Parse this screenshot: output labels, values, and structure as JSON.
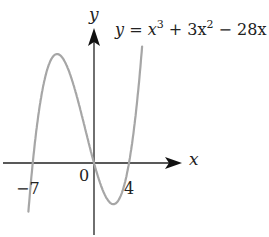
{
  "chart_data": {
    "type": "line",
    "title": "",
    "equation": "y = x^3 + 3x^2 - 28x",
    "equation_parts": {
      "lhs": "y",
      "eq": "=",
      "t1": "x",
      "e1": "3",
      "plus": "+",
      "t2": "3x",
      "e2": "2",
      "minus": "−",
      "t3": "28x"
    },
    "xlabel": "x",
    "ylabel": "y",
    "x_tick_labels": [
      "−7",
      "0",
      "4"
    ],
    "x_ticks": [
      -7,
      0,
      4
    ],
    "roots": [
      -7,
      0,
      4
    ],
    "local_max": {
      "x": -4.22,
      "y": 96.4
    },
    "local_min": {
      "x": 2.22,
      "y": -36.4
    },
    "xlim": [
      -10.5,
      10
    ],
    "grid": false,
    "legend": null,
    "series": [
      {
        "name": "y = x^3 + 3x^2 - 28x",
        "color": "#a6a6a6"
      }
    ]
  },
  "colors": {
    "curve": "#a6a6a6",
    "axes": "#222222"
  }
}
